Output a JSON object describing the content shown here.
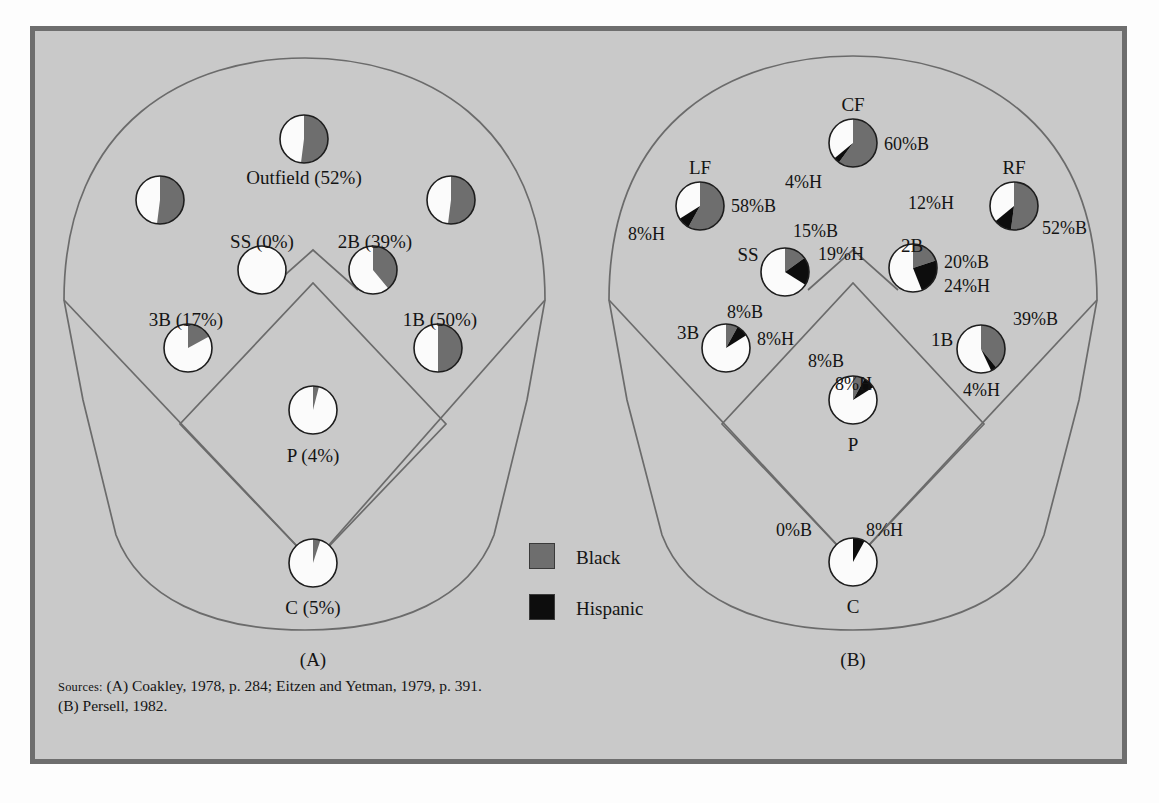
{
  "figure": {
    "background_color": "#c9c9c9",
    "frame_border_color": "#6e6e6e",
    "black_color": "#6e6e6e",
    "hispanic_color": "#0d0d0d",
    "white_color": "#fbfbfb",
    "outline_color": "#6b6b6b"
  },
  "panel_a": {
    "caption": "(A)",
    "positions": [
      {
        "key": "outfield",
        "label": "Outfield (52%)"
      },
      {
        "key": "lf",
        "label": ""
      },
      {
        "key": "rf",
        "label": ""
      },
      {
        "key": "ss",
        "label": "SS (0%)"
      },
      {
        "key": "2b",
        "label": "2B (39%)"
      },
      {
        "key": "3b",
        "label": "3B (17%)"
      },
      {
        "key": "1b",
        "label": "1B (50%)"
      },
      {
        "key": "p",
        "label": "P (4%)"
      },
      {
        "key": "c",
        "label": "C (5%)"
      }
    ]
  },
  "panel_b": {
    "caption": "(B)",
    "positions": [
      {
        "key": "cf",
        "label": "CF",
        "black": "60%B",
        "hispanic": "4%H"
      },
      {
        "key": "lf",
        "label": "LF",
        "black": "58%B",
        "hispanic": "8%H"
      },
      {
        "key": "rf",
        "label": "RF",
        "black": "52%B",
        "hispanic": "12%H"
      },
      {
        "key": "ss",
        "label": "SS",
        "black": "15%B",
        "hispanic": "19%H"
      },
      {
        "key": "2b",
        "label": "2B",
        "black": "20%B",
        "hispanic": "24%H"
      },
      {
        "key": "3b",
        "label": "3B",
        "black": "8%B",
        "hispanic": "8%H"
      },
      {
        "key": "1b",
        "label": "1B",
        "black": "39%B",
        "hispanic": "4%H"
      },
      {
        "key": "p",
        "label": "P",
        "black": "8%B",
        "hispanic": "8%H"
      },
      {
        "key": "c",
        "label": "C",
        "black": "0%B",
        "hispanic": "8%H"
      }
    ]
  },
  "legend": {
    "items": [
      {
        "key": "black",
        "label": "Black",
        "color": "#6e6e6e"
      },
      {
        "key": "hispanic",
        "label": "Hispanic",
        "color": "#0d0d0d"
      }
    ]
  },
  "sources": {
    "prefix": "Sources:",
    "text": " (A) Coakley, 1978, p. 284; Eitzen and Yetman, 1979, p. 391. (B) Persell, 1982."
  },
  "chart_data": {
    "type": "pie",
    "legend": [
      "Black",
      "Hispanic"
    ],
    "legend_position": "center",
    "panels": [
      {
        "name": "(A)",
        "series": [
          "Black"
        ],
        "note": "Each circle is a pie showing percent Black by position",
        "data": [
          {
            "position": "Outfield",
            "label": "Outfield (52%)",
            "black": 52,
            "white": 48
          },
          {
            "position": "LF",
            "label": "",
            "black": 52,
            "white": 48
          },
          {
            "position": "RF",
            "label": "",
            "black": 52,
            "white": 48
          },
          {
            "position": "SS",
            "label": "SS (0%)",
            "black": 0,
            "white": 100
          },
          {
            "position": "2B",
            "label": "2B (39%)",
            "black": 39,
            "white": 61
          },
          {
            "position": "3B",
            "label": "3B (17%)",
            "black": 17,
            "white": 83
          },
          {
            "position": "1B",
            "label": "1B (50%)",
            "black": 50,
            "white": 50
          },
          {
            "position": "P",
            "label": "P (4%)",
            "black": 4,
            "white": 96
          },
          {
            "position": "C",
            "label": "C (5%)",
            "black": 5,
            "white": 95
          }
        ]
      },
      {
        "name": "(B)",
        "series": [
          "Black",
          "Hispanic"
        ],
        "note": "Each circle is a pie showing percent Black and percent Hispanic by position",
        "data": [
          {
            "position": "CF",
            "black": 60,
            "hispanic": 4,
            "white": 36
          },
          {
            "position": "LF",
            "black": 58,
            "hispanic": 8,
            "white": 34
          },
          {
            "position": "RF",
            "black": 52,
            "hispanic": 12,
            "white": 36
          },
          {
            "position": "SS",
            "black": 15,
            "hispanic": 19,
            "white": 66
          },
          {
            "position": "2B",
            "black": 20,
            "hispanic": 24,
            "white": 56
          },
          {
            "position": "3B",
            "black": 8,
            "hispanic": 8,
            "white": 84
          },
          {
            "position": "1B",
            "black": 39,
            "hispanic": 4,
            "white": 57
          },
          {
            "position": "P",
            "black": 8,
            "hispanic": 8,
            "white": 84
          },
          {
            "position": "C",
            "black": 0,
            "hispanic": 8,
            "white": 92
          }
        ]
      }
    ]
  },
  "geometry": {
    "panel_a": {
      "pies": [
        {
          "key": "outfield",
          "cx": 304,
          "cy": 139,
          "r": 24
        },
        {
          "key": "lf",
          "cx": 160,
          "cy": 200,
          "r": 24
        },
        {
          "key": "rf",
          "cx": 451,
          "cy": 200,
          "r": 24
        },
        {
          "key": "ss",
          "cx": 262,
          "cy": 270,
          "r": 24
        },
        {
          "key": "2b",
          "cx": 373,
          "cy": 270,
          "r": 24
        },
        {
          "key": "3b",
          "cx": 188,
          "cy": 348,
          "r": 24
        },
        {
          "key": "1b",
          "cx": 438,
          "cy": 348,
          "r": 24
        },
        {
          "key": "p",
          "cx": 313,
          "cy": 410,
          "r": 24
        },
        {
          "key": "c",
          "cx": 313,
          "cy": 563,
          "r": 24
        }
      ],
      "labels": [
        {
          "key": "outfield",
          "x": 304,
          "y": 170
        },
        {
          "key": "ss",
          "x": 250,
          "y": 240
        },
        {
          "key": "2b",
          "x": 372,
          "y": 240
        },
        {
          "key": "3b",
          "x": 188,
          "y": 317
        },
        {
          "key": "1b",
          "x": 438,
          "y": 317
        },
        {
          "key": "p",
          "x": 313,
          "y": 452
        },
        {
          "key": "c",
          "x": 313,
          "y": 604
        }
      ]
    },
    "panel_b": {
      "pies": [
        {
          "key": "cf",
          "cx": 853,
          "cy": 143,
          "r": 24
        },
        {
          "key": "lf",
          "cx": 700,
          "cy": 206,
          "r": 24
        },
        {
          "key": "rf",
          "cx": 1014,
          "cy": 206,
          "r": 24
        },
        {
          "key": "ss",
          "cx": 785,
          "cy": 272,
          "r": 24
        },
        {
          "key": "2b",
          "cx": 913,
          "cy": 268,
          "r": 24
        },
        {
          "key": "3b",
          "cx": 726,
          "cy": 348,
          "r": 24
        },
        {
          "key": "1b",
          "cx": 981,
          "cy": 349,
          "r": 24
        },
        {
          "key": "p",
          "cx": 853,
          "cy": 400,
          "r": 24
        },
        {
          "key": "c",
          "cx": 853,
          "cy": 562,
          "r": 24
        }
      ]
    }
  }
}
